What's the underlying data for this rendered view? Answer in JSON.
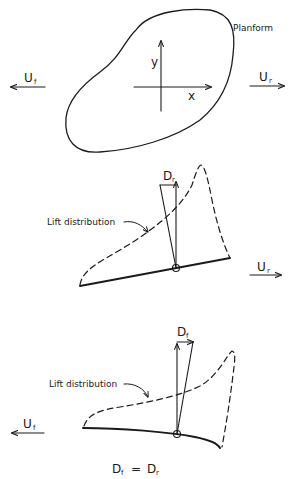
{
  "figure": {
    "planform": {
      "label": "Planform",
      "axis_x": "x",
      "axis_y": "y"
    },
    "flow_top": {
      "front": {
        "symbol": "U",
        "subscript": "f",
        "direction": "left"
      },
      "rear": {
        "symbol": "U",
        "subscript": "r",
        "direction": "right"
      }
    },
    "rear_section": {
      "drag_label": {
        "symbol": "D",
        "subscript": "r"
      },
      "lift_label": "Lift distribution",
      "flow": {
        "symbol": "U",
        "subscript": "r",
        "direction": "right"
      }
    },
    "front_section": {
      "drag_label": {
        "symbol": "D",
        "subscript": "f"
      },
      "lift_label": "Lift distribution",
      "flow": {
        "symbol": "U",
        "subscript": "f",
        "direction": "left"
      }
    },
    "caption": {
      "left": {
        "symbol": "D",
        "subscript": "f"
      },
      "equals": "=",
      "right": {
        "symbol": "D",
        "subscript": "r"
      }
    }
  }
}
